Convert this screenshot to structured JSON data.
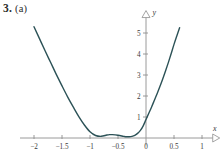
{
  "figure": {
    "problem_number": "3.",
    "part": "(a)"
  },
  "chart_data": {
    "type": "line",
    "title": "",
    "subtitle": "",
    "xlabel": "x",
    "ylabel": "y",
    "grid": false,
    "legend": false,
    "axis_style": "arrowed-cartesian-axes",
    "xlim": [
      -2.25,
      1.12
    ],
    "ylim": [
      -0.35,
      5.45
    ],
    "x_ticks": [
      -2,
      -1.5,
      -1,
      -0.5,
      0,
      0.5,
      1
    ],
    "x_tick_labels": [
      "-2",
      "-1.5",
      "-1",
      "-0.5",
      "0",
      "0.5",
      "1"
    ],
    "y_ticks": [
      1,
      2,
      3,
      4,
      5
    ],
    "y_tick_labels": [
      "1",
      "2",
      "3",
      "4",
      "5"
    ],
    "series": [
      {
        "name": "curve",
        "color": "#2c5257",
        "line_width": 1.4,
        "x": [
          -2.0,
          -1.9,
          -1.8,
          -1.7,
          -1.6,
          -1.5,
          -1.4,
          -1.3,
          -1.2,
          -1.1,
          -1.0,
          -0.9,
          -0.8,
          -0.7,
          -0.65,
          -0.6,
          -0.5,
          -0.4,
          -0.35,
          -0.3,
          -0.25,
          -0.2,
          -0.15,
          -0.1,
          -0.05,
          0.0,
          0.05,
          0.1,
          0.15,
          0.2,
          0.25,
          0.3,
          0.35,
          0.4,
          0.45,
          0.5,
          0.55,
          0.6
        ],
        "y": [
          5.3,
          4.72,
          4.14,
          3.58,
          3.02,
          2.48,
          1.96,
          1.48,
          1.02,
          0.62,
          0.3,
          0.12,
          0.08,
          0.14,
          0.16,
          0.16,
          0.13,
          0.08,
          0.06,
          0.06,
          0.08,
          0.13,
          0.22,
          0.36,
          0.58,
          0.88,
          1.18,
          1.48,
          1.8,
          2.12,
          2.46,
          2.82,
          3.2,
          3.6,
          4.02,
          4.46,
          4.86,
          5.25
        ]
      }
    ],
    "annotations": []
  }
}
